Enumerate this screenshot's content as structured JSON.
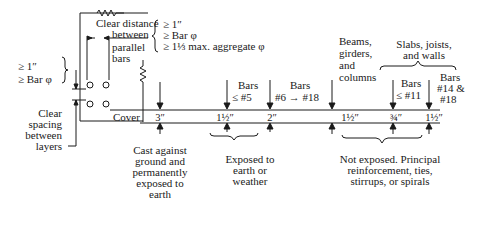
{
  "diagram": {
    "section_detail": {
      "clear_distance_label": [
        "Clear distance",
        "between",
        "parallel",
        "bars"
      ],
      "clear_distance_reqs": [
        "≥ 1″",
        "≥ Bar φ",
        "≥ 1⅓ max. aggregate φ"
      ],
      "layer_reqs": [
        "≥ 1″",
        "≥ Bar φ"
      ],
      "layer_label": [
        "Clear",
        "spacing",
        "between",
        "layers"
      ],
      "cover_label": "Cover"
    },
    "cover_values": [
      {
        "value": "3″",
        "condition_above": "",
        "group": "cast"
      },
      {
        "value": "1½″",
        "condition_above": [
          "Bars",
          "≤ #5"
        ],
        "group": "exposed"
      },
      {
        "value": "2″",
        "condition_above": [
          "Bars",
          "#6 → #18"
        ],
        "group": "exposed"
      },
      {
        "value": "1½″",
        "condition_above": [
          "Beams,",
          "girders,",
          "and",
          "columns"
        ],
        "group": "not_exposed"
      },
      {
        "value": "¾″",
        "condition_above": [
          "Bars",
          "≤ #11"
        ],
        "group": "not_exposed"
      },
      {
        "value": "1½″",
        "condition_above": [
          "Bars",
          "#14 &",
          "#18"
        ],
        "group": "not_exposed"
      }
    ],
    "top_group_label": [
      "Slabs, joists,",
      "and walls"
    ],
    "bottom_groups": {
      "cast": [
        "Cast against",
        "ground and",
        "permanently",
        "exposed to",
        "earth"
      ],
      "exposed": [
        "Exposed to",
        "earth or",
        "weather"
      ],
      "not_exposed": [
        "Not exposed. Principal",
        "reinforcement, ties,",
        "stirrups, or spirals"
      ]
    }
  }
}
